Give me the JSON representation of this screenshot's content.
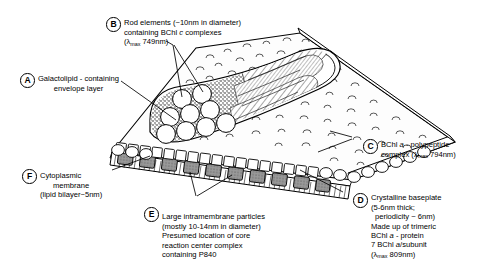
{
  "figure": {
    "background_color": "#ffffff",
    "ink_color": "#000000"
  },
  "labels": [
    {
      "key": "A",
      "name": "galactolipid-envelope-layer",
      "lines": [
        "Galactolipid - containing",
        "envelope layer"
      ]
    },
    {
      "key": "B",
      "name": "rod-elements",
      "lines": [
        "Rod elements (~10nm in diameter)",
        "containing BChl c complexes",
        "(λmax 749nm)"
      ],
      "line1": "Rod elements (~10nm in diameter)",
      "line2_a": "containing BChl ",
      "line2_italic": "c",
      "line2_b": " complexes",
      "line3_pre": "(",
      "line3_lambda": "λ",
      "line3_sub": "max",
      "line3_post": " 749nm)"
    },
    {
      "key": "C",
      "name": "bchl-a-polypeptide-complex",
      "line1_a": "BChl ",
      "line1_italic": "a",
      "line1_b": " - polypeptide",
      "line2_pre": "complex (",
      "line2_lambda": "λ",
      "line2_sub": "max",
      "line2_post": " 794nm)"
    },
    {
      "key": "D",
      "name": "crystalline-baseplate",
      "line1": "Crystalline baseplate",
      "line2": "(5-6nm thick;",
      "line3": "periodicity ~ 6nm)",
      "line4": "Made up of trimeric",
      "line5_a": "BChl ",
      "line5_italic": "a",
      "line5_b": " - protein",
      "line6_a": "7 BChl ",
      "line6_italic": "a",
      "line6_b": "/subunit",
      "line7_pre": "(",
      "line7_lambda": "λ",
      "line7_sub": "max",
      "line7_post": " 809nm)"
    },
    {
      "key": "E",
      "name": "large-intramembrane-particles",
      "line1": "Large intramembrane particles",
      "line2": "(mostly 10-14nm in diameter)",
      "line3": "Presumed location of core",
      "line4": "reaction center complex",
      "line5": "containing P840"
    },
    {
      "key": "F",
      "name": "cytoplasmic-membrane",
      "line1": "Cytoplasmic",
      "line2": "membrane",
      "line3": "(lipid bilayer~5nm)"
    }
  ]
}
